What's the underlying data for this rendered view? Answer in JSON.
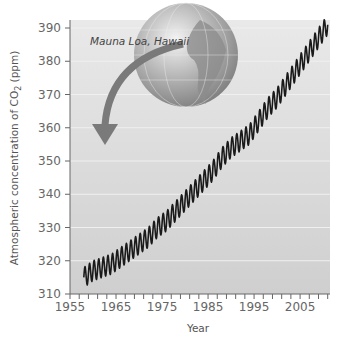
{
  "chart_data": {
    "type": "line",
    "title": "",
    "xlabel": "Year",
    "ylabel": "Atmospheric concentration of CO2 (ppm)",
    "ylabel_main": "Atmospheric concentration of CO",
    "ylabel_sub": "2",
    "ylabel_unit": " (ppm)",
    "xlim": [
      1955,
      2011.5
    ],
    "ylim": [
      310,
      390
    ],
    "xticks": [
      "1955",
      "1965",
      "1975",
      "1985",
      "1995",
      "2005"
    ],
    "yticks": [
      "310",
      "320",
      "330",
      "340",
      "350",
      "360",
      "370",
      "380",
      "390"
    ],
    "grid": true,
    "annotation": "Mauna Loa, Hawaii",
    "series": [
      {
        "name": "Keeling curve (monthly CO2, with seasonal cycle)",
        "seasonal_amplitude_ppm": 6,
        "x": [
          1958,
          1960,
          1962,
          1964,
          1966,
          1968,
          1970,
          1972,
          1974,
          1976,
          1978,
          1980,
          1982,
          1984,
          1986,
          1988,
          1990,
          1992,
          1994,
          1996,
          1998,
          2000,
          2002,
          2004,
          2006,
          2008,
          2010,
          2011
        ],
        "values": [
          315,
          317,
          318,
          319,
          321,
          323,
          325,
          327,
          330,
          332,
          335,
          338,
          341,
          344,
          347,
          351,
          354,
          356,
          358,
          362,
          366,
          369,
          373,
          377,
          381,
          385,
          389,
          391
        ]
      }
    ]
  },
  "colors": {
    "plot_background": "#d6d6d6",
    "gridline": "#f0f0f0",
    "line": "#1a1a1a",
    "arrow": "#7a7a7a",
    "globe_ocean": "#a9a9a9",
    "globe_land": "#8c8c8c"
  }
}
